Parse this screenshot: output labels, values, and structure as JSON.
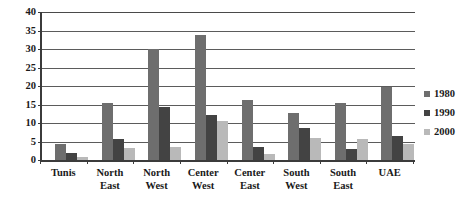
{
  "chart_data": {
    "type": "bar",
    "title": "",
    "subtitle": "",
    "xlabel": "",
    "ylabel": "",
    "ylim": [
      0,
      40
    ],
    "ytick_step": 5,
    "yticks": [
      "40",
      "35",
      "30",
      "25",
      "20",
      "15",
      "10",
      "5",
      "0"
    ],
    "grid": true,
    "grid_axis": "y",
    "legend_position": "right",
    "categories": [
      "Tunis",
      "North East",
      "North West",
      "Center West",
      "Center East",
      "South West",
      "South East",
      "UAE"
    ],
    "category_lines": [
      [
        "Tunis"
      ],
      [
        "North",
        "East"
      ],
      [
        "North",
        "West"
      ],
      [
        "Center",
        "West"
      ],
      [
        "Center",
        "East"
      ],
      [
        "South",
        "West"
      ],
      [
        "South",
        "East"
      ],
      [
        "UAE"
      ]
    ],
    "series": [
      {
        "name": "1980",
        "color": "#6e6e6e",
        "values": [
          4.2,
          15.5,
          30.0,
          33.7,
          16.3,
          12.8,
          15.5,
          19.7
        ]
      },
      {
        "name": "1990",
        "color": "#434343",
        "values": [
          1.9,
          5.7,
          14.2,
          12.3,
          3.6,
          8.6,
          2.9,
          6.4
        ]
      },
      {
        "name": "2000",
        "color": "#b9b9b9",
        "values": [
          0.8,
          3.3,
          3.5,
          10.5,
          1.6,
          6.0,
          5.7,
          4.2
        ]
      }
    ]
  },
  "colors": {
    "axis": "#3b3b3b",
    "gridline": "#5b5b5b",
    "text": "#1a1a1a",
    "background": "#ffffff",
    "series_1980": "#6e6e6e",
    "series_1990": "#434343",
    "series_2000": "#b9b9b9"
  }
}
